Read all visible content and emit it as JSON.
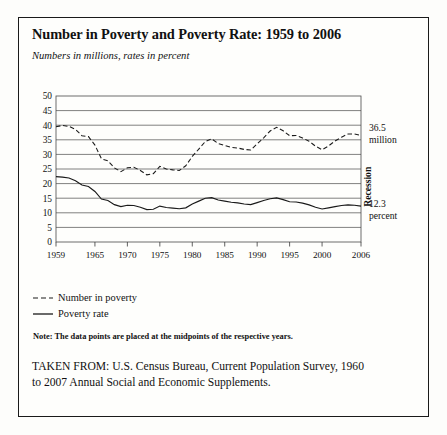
{
  "figure": {
    "title": "Number in Poverty and Poverty Rate: 1959 to 2006",
    "subtitle": "Numbers in millions, rates in percent",
    "note": "Note: The data points are placed at the midpoints of the respective years.",
    "source_line_1": "TAKEN FROM: U.S. Census Bureau, Current Population Survey, 1960",
    "source_line_2": "to 2007 Annual Social and Economic Supplements."
  },
  "legend": {
    "items": [
      {
        "label": "Number in poverty",
        "style": "dashed",
        "color": "#1a1a1a"
      },
      {
        "label": "Poverty rate",
        "style": "solid",
        "color": "#1a1a1a"
      }
    ]
  },
  "callouts": {
    "number_value": "36.5",
    "number_unit": "million",
    "rate_value": "12.3",
    "rate_unit": "percent",
    "recession_label": "Recession"
  },
  "chart_data": {
    "type": "line",
    "title": "Number in Poverty and Poverty Rate: 1959 to 2006",
    "subtitle": "Numbers in millions, rates in percent",
    "xlabel": "",
    "ylabel": "",
    "xlim": [
      1959,
      2006
    ],
    "ylim": [
      0,
      50
    ],
    "yticks": [
      0,
      5,
      10,
      15,
      20,
      25,
      30,
      35,
      40,
      45,
      50
    ],
    "xticks": [
      1959,
      1965,
      1970,
      1975,
      1980,
      1985,
      1990,
      1995,
      2000,
      2006
    ],
    "xtick_labels": [
      "1959",
      "1965",
      "1970",
      "1975",
      "1980",
      "1985",
      "1990",
      "1995",
      "2000",
      "2006"
    ],
    "ytick_labels": [
      "0",
      "5",
      "10",
      "15",
      "20",
      "25",
      "30",
      "35",
      "40",
      "45",
      "50"
    ],
    "grid": "horizontal",
    "legend_position": "below-left",
    "x": [
      1959,
      1960,
      1961,
      1962,
      1963,
      1964,
      1965,
      1966,
      1967,
      1968,
      1969,
      1970,
      1971,
      1972,
      1973,
      1974,
      1975,
      1976,
      1977,
      1978,
      1979,
      1980,
      1981,
      1982,
      1983,
      1984,
      1985,
      1986,
      1987,
      1988,
      1989,
      1990,
      1991,
      1992,
      1993,
      1994,
      1995,
      1996,
      1997,
      1998,
      1999,
      2000,
      2001,
      2002,
      2003,
      2004,
      2005,
      2006
    ],
    "series": [
      {
        "name": "Number in poverty",
        "style": "dashed",
        "unit": "millions",
        "last_value": 36.5,
        "values": [
          39.5,
          39.9,
          39.6,
          38.6,
          36.4,
          36.1,
          33.2,
          28.5,
          27.8,
          25.4,
          24.1,
          25.4,
          25.6,
          24.5,
          23.0,
          23.4,
          25.9,
          25.0,
          24.7,
          24.5,
          26.1,
          29.3,
          31.8,
          34.4,
          35.3,
          33.7,
          33.1,
          32.4,
          32.2,
          31.7,
          31.5,
          33.6,
          35.7,
          38.0,
          39.3,
          38.1,
          36.4,
          36.5,
          35.6,
          34.5,
          32.8,
          31.6,
          32.9,
          34.6,
          35.9,
          37.0,
          37.0,
          36.5
        ]
      },
      {
        "name": "Poverty rate",
        "style": "solid",
        "unit": "percent",
        "last_value": 12.3,
        "values": [
          22.4,
          22.2,
          21.9,
          21.0,
          19.5,
          19.0,
          17.3,
          14.7,
          14.2,
          12.8,
          12.1,
          12.6,
          12.5,
          11.9,
          11.1,
          11.2,
          12.3,
          11.8,
          11.6,
          11.4,
          11.7,
          13.0,
          14.0,
          15.0,
          15.2,
          14.4,
          14.0,
          13.6,
          13.4,
          13.0,
          12.8,
          13.5,
          14.2,
          14.8,
          15.1,
          14.5,
          13.8,
          13.7,
          13.3,
          12.7,
          11.9,
          11.3,
          11.7,
          12.1,
          12.5,
          12.7,
          12.6,
          12.3
        ]
      }
    ],
    "recessions": [
      {
        "start": 1960.3,
        "end": 1961.1
      },
      {
        "start": 1969.9,
        "end": 1970.9
      },
      {
        "start": 1973.9,
        "end": 1975.2
      },
      {
        "start": 1980.0,
        "end": 1980.5
      },
      {
        "start": 1981.5,
        "end": 1982.9
      },
      {
        "start": 1990.5,
        "end": 1991.2
      },
      {
        "start": 2001.2,
        "end": 2001.9
      }
    ]
  }
}
